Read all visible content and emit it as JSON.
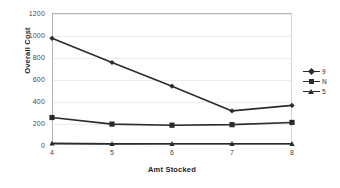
{
  "chart_data": {
    "type": "line",
    "title": "",
    "xlabel": "Amt Stocked",
    "ylabel": "Overall Cost",
    "categories": [
      "4",
      "5",
      "6",
      "7",
      "8"
    ],
    "x": [
      4,
      5,
      6,
      7,
      8
    ],
    "xlim": [
      4,
      8
    ],
    "ylim": [
      0,
      1200
    ],
    "yticks": [
      0,
      200,
      400,
      600,
      800,
      1000,
      1200
    ],
    "ytick_labels": [
      "0",
      "200",
      "400",
      "600",
      "800",
      "1000",
      "1200"
    ],
    "grid": true,
    "legend_position": "right",
    "series": [
      {
        "name": "9",
        "marker": "diamond",
        "color": "#2b2b2b",
        "values": [
          970,
          750,
          535,
          310,
          360
        ]
      },
      {
        "name": "N",
        "marker": "square",
        "color": "#2b2b2b",
        "values": [
          250,
          190,
          180,
          185,
          205
        ]
      },
      {
        "name": "5",
        "marker": "triangle",
        "color": "#2b2b2b",
        "values": [
          15,
          10,
          12,
          12,
          12
        ]
      }
    ]
  },
  "axes": {
    "y_ticks": [
      {
        "label": "1200"
      },
      {
        "label": "1000"
      },
      {
        "label": "800"
      },
      {
        "label": "600"
      },
      {
        "label": "400"
      },
      {
        "label": "200"
      },
      {
        "label": "0"
      }
    ],
    "x_ticks": [
      {
        "label": "4"
      },
      {
        "label": "5"
      },
      {
        "label": "6"
      },
      {
        "label": "7"
      },
      {
        "label": "8"
      }
    ],
    "x_axis_title": "Amt Stocked",
    "y_axis_title": "Overall Cost"
  },
  "legend": {
    "items": [
      {
        "label": "9",
        "marker": "diamond"
      },
      {
        "label": "N",
        "marker": "square"
      },
      {
        "label": "5",
        "marker": "triangle"
      }
    ]
  },
  "colors": {
    "series": "#2b2b2b",
    "grid": "#ededed",
    "frame": "#b6b6b6",
    "tick_text": "#4a4a4a",
    "axis_title": "#1d1d1d",
    "background": "#ffffff"
  }
}
